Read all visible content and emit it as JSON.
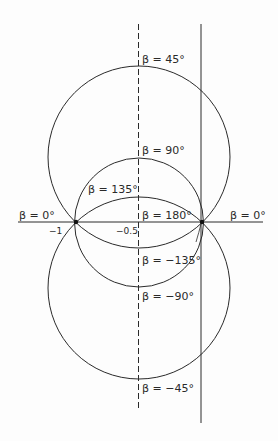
{
  "diagram": {
    "type": "circles-on-real-axis",
    "axis": {
      "tick_labels": [
        "-1",
        "-0.5"
      ]
    },
    "labels": {
      "beta_45": "β = 45°",
      "beta_90": "β = 90°",
      "beta_135": "β = 135°",
      "beta_180": "β = 180°",
      "beta_0_left": "β = 0°",
      "beta_0_right": "β = 0°",
      "beta_m135": "β = −135°",
      "beta_m90": "β = −90°",
      "beta_m45": "β = −45°"
    },
    "tick_minus1": "−1",
    "tick_minus05": "−0.5",
    "colors": {
      "line": "#2a2a2a",
      "background": "#fdfdfd"
    }
  }
}
